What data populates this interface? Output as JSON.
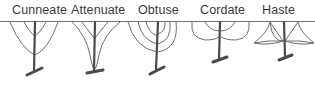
{
  "diagram": {
    "colors": {
      "line": "#6e6e6e",
      "stem": "#4a4a4a",
      "text": "#3a3a3a",
      "background": "#ffffff"
    },
    "shapes": [
      {
        "id": "cunneate",
        "label": "Cunneate"
      },
      {
        "id": "attenuate",
        "label": "Attenuate"
      },
      {
        "id": "obtuse",
        "label": "Obtuse"
      },
      {
        "id": "cordate",
        "label": "Cordate"
      },
      {
        "id": "haste",
        "label": "Haste"
      }
    ]
  }
}
